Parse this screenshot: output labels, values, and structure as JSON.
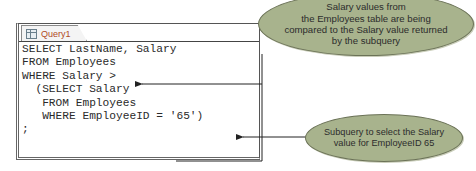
{
  "query_window": {
    "tab": {
      "label": "Query1",
      "icon": "query-sql-icon"
    },
    "sql_lines": [
      "SELECT LastName, Salary",
      "FROM Employees",
      "WHERE Salary >",
      "  (SELECT Salary",
      "   FROM Employees",
      "   WHERE EmployeeID = '65')",
      ";"
    ]
  },
  "callouts": [
    {
      "lines": [
        "Salary values from",
        "the Employees table are being",
        "compared to the Salary value returned",
        "by the subquery"
      ],
      "points_to": "WHERE Salary >"
    },
    {
      "lines": [
        "Subquery to select the Salary",
        "value for EmployeeID 65"
      ],
      "points_to": "WHERE EmployeeID = '65')"
    }
  ],
  "colors": {
    "callout_fill": "#a8b38d",
    "tab_label": "#b04a1e",
    "code_text": "#2a2a2a"
  }
}
